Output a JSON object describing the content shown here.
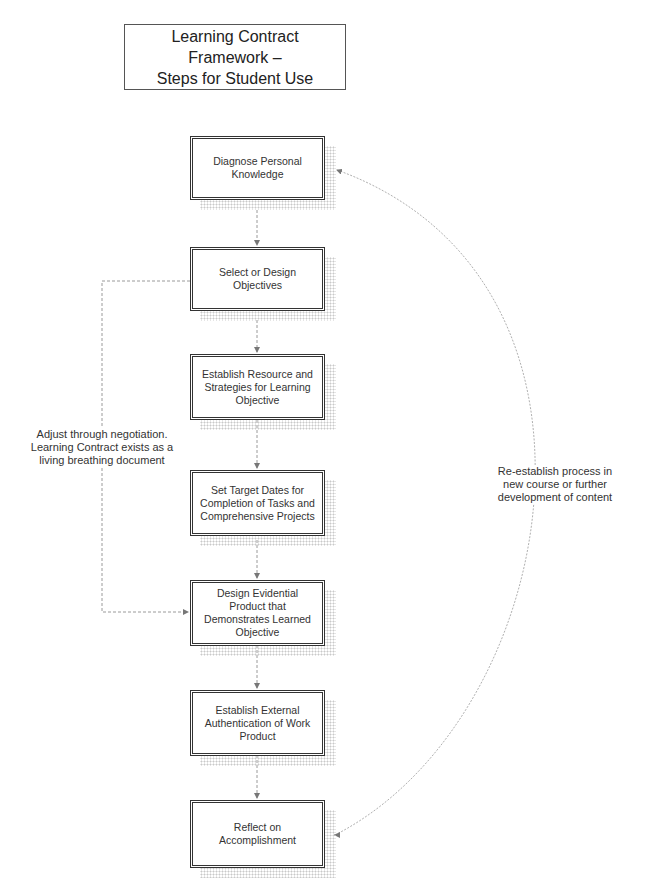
{
  "title": {
    "line1": "Learning Contract Framework –",
    "line2": "Steps for Student Use"
  },
  "steps": [
    {
      "label": "Diagnose Personal Knowledge"
    },
    {
      "label": "Select or Design Objectives"
    },
    {
      "label": "Establish Resource and Strategies for Learning Objective"
    },
    {
      "label": "Set Target Dates for Completion of Tasks and Comprehensive Projects"
    },
    {
      "label": "Design Evidential Product that Demonstrates Learned Objective"
    },
    {
      "label": "Establish External Authentication of Work Product"
    },
    {
      "label": "Reflect on Accomplishment"
    }
  ],
  "annotations": {
    "left_loop": "Adjust through negotiation. Learning Contract exists as a living breathing document",
    "right_loop": "Re-establish process in new course or further development of content"
  },
  "colors": {
    "box_border": "#333333",
    "connector": "#9a9a9a",
    "shadow_dots": "#c9c9c9"
  }
}
